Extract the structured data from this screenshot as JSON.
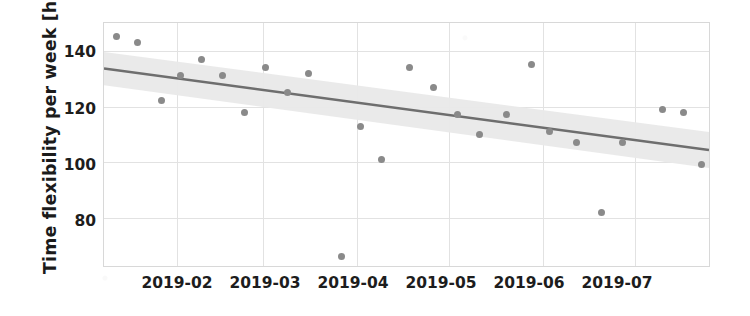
{
  "chart_data": {
    "type": "scatter",
    "title": "",
    "xlabel": "",
    "ylabel": "Time flexibility per week [h]",
    "grid": true,
    "legend": false,
    "xtick_labels": [
      "2019-02",
      "2019-03",
      "2019-04",
      "2019-05",
      "2019-06",
      "2019-07"
    ],
    "ytick_labels": [
      "140",
      "120",
      "100",
      "80"
    ],
    "ytick_values": [
      140,
      120,
      100,
      80
    ],
    "ylim": [
      62,
      150
    ],
    "xlim": [
      "2019-01-08",
      "2019-07-26"
    ],
    "points": [
      {
        "x": "2019-01-12",
        "y": 145
      },
      {
        "x": "2019-01-19",
        "y": 143
      },
      {
        "x": "2019-01-27",
        "y": 122
      },
      {
        "x": "2019-02-02",
        "y": 131
      },
      {
        "x": "2019-02-09",
        "y": 137
      },
      {
        "x": "2019-02-16",
        "y": 131
      },
      {
        "x": "2019-02-23",
        "y": 118
      },
      {
        "x": "2019-03-02",
        "y": 134
      },
      {
        "x": "2019-03-09",
        "y": 125
      },
      {
        "x": "2019-03-16",
        "y": 132
      },
      {
        "x": "2019-03-27",
        "y": 66
      },
      {
        "x": "2019-04-02",
        "y": 113
      },
      {
        "x": "2019-04-09",
        "y": 101
      },
      {
        "x": "2019-04-18",
        "y": 134
      },
      {
        "x": "2019-04-26",
        "y": 127
      },
      {
        "x": "2019-05-04",
        "y": 117
      },
      {
        "x": "2019-05-11",
        "y": 110
      },
      {
        "x": "2019-05-20",
        "y": 117
      },
      {
        "x": "2019-05-28",
        "y": 135
      },
      {
        "x": "2019-06-03",
        "y": 111
      },
      {
        "x": "2019-06-12",
        "y": 107
      },
      {
        "x": "2019-06-20",
        "y": 82
      },
      {
        "x": "2019-06-27",
        "y": 107
      },
      {
        "x": "2019-07-10",
        "y": 119
      },
      {
        "x": "2019-07-17",
        "y": 118
      },
      {
        "x": "2019-07-23",
        "y": 99
      }
    ],
    "trend": {
      "name": "linear fit",
      "y_start": 133.5,
      "y_end": 104.0,
      "color": "#6e6e6e"
    },
    "confidence_band": {
      "upper_start": 139.5,
      "upper_end": 110.5,
      "lower_start": 127.5,
      "lower_end": 97.5,
      "color": "#e9e9e9"
    },
    "marker_color": "#8a8a8a"
  }
}
